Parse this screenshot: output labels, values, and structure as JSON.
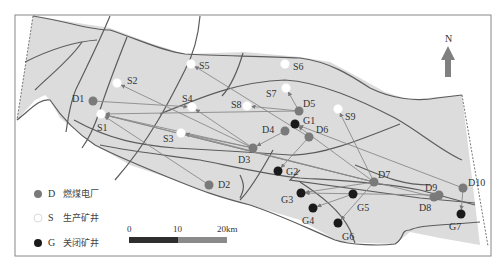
{
  "map": {
    "frame": {
      "x": 15,
      "y": 15,
      "width": 476,
      "height": 241
    },
    "colors": {
      "basin_fill": "#dcdcdc",
      "fault_line": "#5c5c5c",
      "flow_line": "#8a8a8a",
      "power_plant": "#7a7a7a",
      "production_mine": "#ffffff",
      "closed_mine": "#1a1a1a",
      "north_arrow": "#808080",
      "frame": "#888888"
    },
    "north_arrow": {
      "label": "N",
      "x": 448,
      "y": 44
    },
    "power_plants": [
      {
        "id": "D1",
        "x": 93,
        "y": 101,
        "lx": 72,
        "ly": 102
      },
      {
        "id": "D2",
        "x": 209,
        "y": 185,
        "lx": 218,
        "ly": 188
      },
      {
        "id": "D3",
        "x": 253,
        "y": 148,
        "lx": 238,
        "ly": 163
      },
      {
        "id": "D4",
        "x": 285,
        "y": 131,
        "lx": 262,
        "ly": 133
      },
      {
        "id": "D5",
        "x": 299,
        "y": 111,
        "lx": 303,
        "ly": 107
      },
      {
        "id": "D6",
        "x": 309,
        "y": 137,
        "lx": 316,
        "ly": 133
      },
      {
        "id": "D7",
        "x": 374,
        "y": 182,
        "lx": 378,
        "ly": 178
      },
      {
        "id": "D8",
        "x": 434,
        "y": 197,
        "lx": 419,
        "ly": 211
      },
      {
        "id": "D9",
        "x": 439,
        "y": 195,
        "lx": 425,
        "ly": 191
      },
      {
        "id": "D10",
        "x": 463,
        "y": 188,
        "lx": 468,
        "ly": 186
      }
    ],
    "production_mines": [
      {
        "id": "S1",
        "x": 101,
        "y": 114,
        "lx": 97,
        "ly": 131
      },
      {
        "id": "S2",
        "x": 117,
        "y": 83,
        "lx": 127,
        "ly": 84
      },
      {
        "id": "S3",
        "x": 181,
        "y": 133,
        "lx": 163,
        "ly": 142
      },
      {
        "id": "S4",
        "x": 192,
        "y": 107,
        "lx": 182,
        "ly": 102
      },
      {
        "id": "S5",
        "x": 191,
        "y": 64,
        "lx": 199,
        "ly": 69
      },
      {
        "id": "S6",
        "x": 285,
        "y": 64,
        "lx": 293,
        "ly": 70
      },
      {
        "id": "S7",
        "x": 286,
        "y": 88,
        "lx": 266,
        "ly": 97
      },
      {
        "id": "S8",
        "x": 247,
        "y": 106,
        "lx": 231,
        "ly": 108
      },
      {
        "id": "S9",
        "x": 338,
        "y": 109,
        "lx": 345,
        "ly": 120
      }
    ],
    "closed_mines": [
      {
        "id": "G1",
        "x": 295,
        "y": 124,
        "lx": 303,
        "ly": 124
      },
      {
        "id": "G2",
        "x": 278,
        "y": 171,
        "lx": 286,
        "ly": 175
      },
      {
        "id": "G3",
        "x": 301,
        "y": 193,
        "lx": 281,
        "ly": 203
      },
      {
        "id": "G4",
        "x": 313,
        "y": 208,
        "lx": 302,
        "ly": 224
      },
      {
        "id": "G5",
        "x": 353,
        "y": 194,
        "lx": 357,
        "ly": 211
      },
      {
        "id": "G6",
        "x": 338,
        "y": 223,
        "lx": 342,
        "ly": 240
      },
      {
        "id": "G7",
        "x": 461,
        "y": 214,
        "lx": 449,
        "ly": 230
      }
    ],
    "flows": [
      {
        "from": "D1",
        "to": "S4"
      },
      {
        "from": "D3",
        "to": "S1"
      },
      {
        "from": "D3",
        "to": "S2"
      },
      {
        "from": "D3",
        "to": "S3"
      },
      {
        "from": "D2",
        "to": "S1"
      },
      {
        "from": "D5",
        "to": "S1"
      },
      {
        "from": "D5",
        "to": "S7"
      },
      {
        "from": "D5",
        "to": "S8"
      },
      {
        "from": "D6",
        "to": "S5"
      },
      {
        "from": "D7",
        "to": "S1"
      },
      {
        "from": "D7",
        "to": "S3"
      },
      {
        "from": "D7",
        "to": "S9"
      },
      {
        "from": "D7",
        "to": "G1"
      },
      {
        "from": "D8",
        "to": "S1"
      },
      {
        "from": "D10",
        "to": "G1"
      },
      {
        "from": "D10",
        "to": "G7"
      },
      {
        "from": "D4",
        "to": "D3"
      },
      {
        "from": "D6",
        "to": "G2"
      },
      {
        "from": "D7",
        "to": "G3"
      },
      {
        "from": "D7",
        "to": "G6"
      },
      {
        "from": "D9",
        "to": "G3"
      },
      {
        "from": "G5",
        "to": "G4"
      },
      {
        "from": "D3",
        "to": "S4"
      }
    ]
  },
  "legend": {
    "items": [
      {
        "symbol": "D",
        "label": "燃煤电厂",
        "type": "power-plant"
      },
      {
        "symbol": "S",
        "label": "生产矿井",
        "type": "production-mine"
      },
      {
        "symbol": "G",
        "label": "关闭矿井",
        "type": "closed-mine"
      }
    ]
  },
  "scale_bar": {
    "ticks": [
      "0",
      "10",
      "20km"
    ]
  }
}
